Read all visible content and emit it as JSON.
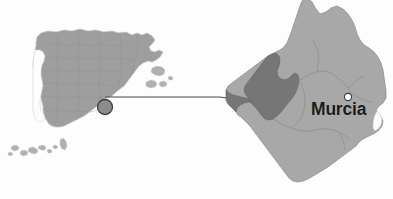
{
  "figure": {
    "type": "locator-map",
    "caption": "",
    "background_color": "#fdfdfd"
  },
  "labels": {
    "city_murcia": "Murcia"
  },
  "colors": {
    "spain_fill": "#9e9e9e",
    "spain_stroke": "#bdbdbd",
    "spain_internal_borders": "#8a8a8a",
    "islands_fill": "#b3b3b3",
    "murcia_region_fill": "#a8a8a8",
    "murcia_region_stroke": "#8f8f8f",
    "highlight_municipality_fill": "#767676",
    "highlight_municipality_stroke": "#6a6a6a",
    "murcia_internal_borders": "#8a8a8a",
    "locator_circle_fill": "#8c8c8c",
    "locator_circle_stroke": "#3d3d3d",
    "connector_line": "#4a4a4a",
    "site_dot": "#111111",
    "city_dot_fill": "#ffffff",
    "city_dot_stroke": "#3a3a3a",
    "label_text": "#1a1a1a",
    "caption_text": "#e6e6e6"
  },
  "markers": {
    "locator_circle": {
      "x": 105,
      "y": 107,
      "r": 7.5
    },
    "site_dot": {
      "x": 252,
      "y": 101,
      "r": 4.2
    },
    "city_dot": {
      "x": 348,
      "y": 97,
      "r": 3.6
    }
  },
  "connector": {
    "from_x": 105,
    "from_y": 97,
    "to_x": 252,
    "to_y": 101
  }
}
